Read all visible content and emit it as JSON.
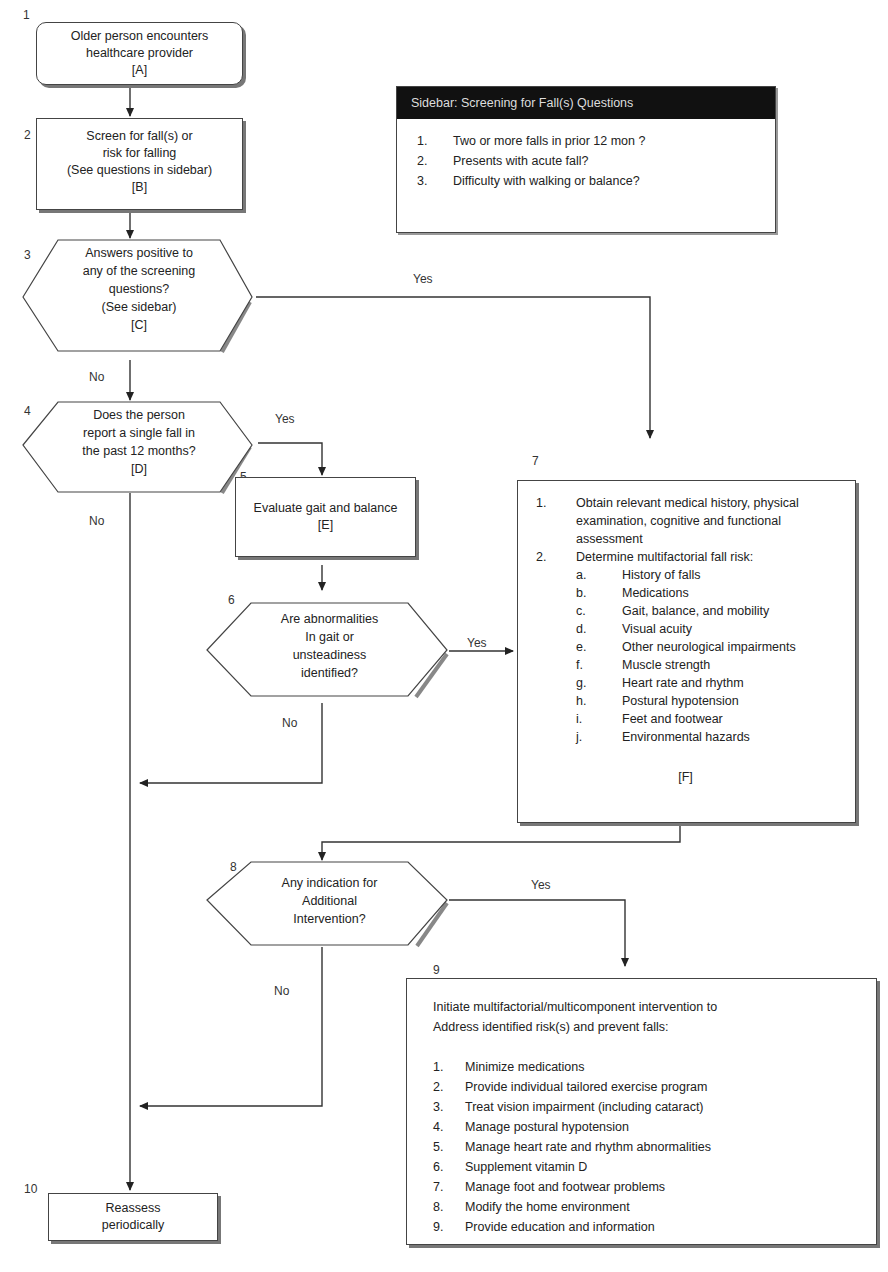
{
  "diagram": {
    "type": "flowchart",
    "nodes": [
      {
        "id": "1",
        "shape": "rounded-rect",
        "lines": [
          "Older person encounters",
          "healthcare provider",
          "[A]"
        ]
      },
      {
        "id": "2",
        "shape": "rect",
        "lines": [
          "Screen for fall(s) or",
          "risk for falling",
          "(See questions in sidebar)",
          "[B]"
        ]
      },
      {
        "id": "3",
        "shape": "hexagon",
        "lines": [
          "Answers positive to",
          "any of the screening",
          "questions?",
          "(See sidebar)",
          "[C]"
        ]
      },
      {
        "id": "4",
        "shape": "hexagon",
        "lines": [
          "Does the person",
          "report a single fall in",
          "the past 12 months?",
          "[D]"
        ]
      },
      {
        "id": "5",
        "shape": "rect",
        "lines": [
          "Evaluate gait and balance",
          "[E]"
        ]
      },
      {
        "id": "6",
        "shape": "hexagon",
        "lines": [
          "Are abnormalities",
          "In gait or",
          "unsteadiness",
          "identified?"
        ]
      },
      {
        "id": "7",
        "shape": "rect",
        "items": [
          {
            "marker": "1.",
            "text": "Obtain relevant medical history, physical examination, cognitive and functional assessment"
          },
          {
            "marker": "2.",
            "text": "Determine multifactorial fall risk:"
          }
        ],
        "subitems": [
          {
            "marker": "a.",
            "text": "History of falls"
          },
          {
            "marker": "b.",
            "text": "Medications"
          },
          {
            "marker": "c.",
            "text": "Gait, balance, and mobility"
          },
          {
            "marker": "d.",
            "text": "Visual acuity"
          },
          {
            "marker": "e.",
            "text": "Other neurological impairments"
          },
          {
            "marker": "f.",
            "text": "Muscle strength"
          },
          {
            "marker": "g.",
            "text": "Heart rate and rhythm"
          },
          {
            "marker": "h.",
            "text": "Postural hypotension"
          },
          {
            "marker": "i.",
            "text": "Feet and footwear"
          },
          {
            "marker": "j.",
            "text": "Environmental hazards"
          }
        ],
        "tag": "[F]"
      },
      {
        "id": "8",
        "shape": "hexagon",
        "lines": [
          "Any indication for",
          "Additional",
          "Intervention?"
        ]
      },
      {
        "id": "9",
        "shape": "rect",
        "intro": [
          "Initiate multifactorial/multicomponent intervention to",
          "Address identified risk(s) and prevent falls:"
        ],
        "items": [
          {
            "marker": "1.",
            "text": "Minimize medications"
          },
          {
            "marker": "2.",
            "text": "Provide individual tailored exercise program"
          },
          {
            "marker": "3.",
            "text": "Treat vision impairment (including cataract)"
          },
          {
            "marker": "4.",
            "text": "Manage postural hypotension"
          },
          {
            "marker": "5.",
            "text": "Manage heart rate and rhythm abnormalities"
          },
          {
            "marker": "6.",
            "text": "Supplement vitamin D"
          },
          {
            "marker": "7.",
            "text": "Manage foot and footwear problems"
          },
          {
            "marker": "8.",
            "text": "Modify the home environment"
          },
          {
            "marker": "9.",
            "text": "Provide education and information"
          }
        ]
      },
      {
        "id": "10",
        "shape": "rect",
        "lines": [
          "Reassess",
          "periodically"
        ]
      }
    ],
    "edges": [
      {
        "from": "1",
        "to": "2",
        "label": ""
      },
      {
        "from": "2",
        "to": "3",
        "label": ""
      },
      {
        "from": "3",
        "to": "7",
        "label": "Yes"
      },
      {
        "from": "3",
        "to": "4",
        "label": "No"
      },
      {
        "from": "4",
        "to": "5",
        "label": "Yes"
      },
      {
        "from": "4",
        "to": "10",
        "label": "No"
      },
      {
        "from": "5",
        "to": "6",
        "label": ""
      },
      {
        "from": "6",
        "to": "7",
        "label": "Yes"
      },
      {
        "from": "6",
        "to": "10",
        "label": "No"
      },
      {
        "from": "7",
        "to": "8",
        "label": ""
      },
      {
        "from": "8",
        "to": "9",
        "label": "Yes"
      },
      {
        "from": "8",
        "to": "10",
        "label": "No"
      }
    ],
    "edge_labels": {
      "yes": "Yes",
      "no": "No"
    }
  },
  "sidebar": {
    "title": "Sidebar:  Screening for Fall(s) Questions",
    "items": [
      {
        "marker": "1.",
        "text": "Two or more falls in prior 12 mon ?"
      },
      {
        "marker": "2.",
        "text": "Presents with acute fall?"
      },
      {
        "marker": "3.",
        "text": "Difficulty with walking or balance?"
      }
    ]
  },
  "colors": {
    "line": "#333333",
    "sidebar_header": "#111111",
    "shadow": "#777777"
  }
}
